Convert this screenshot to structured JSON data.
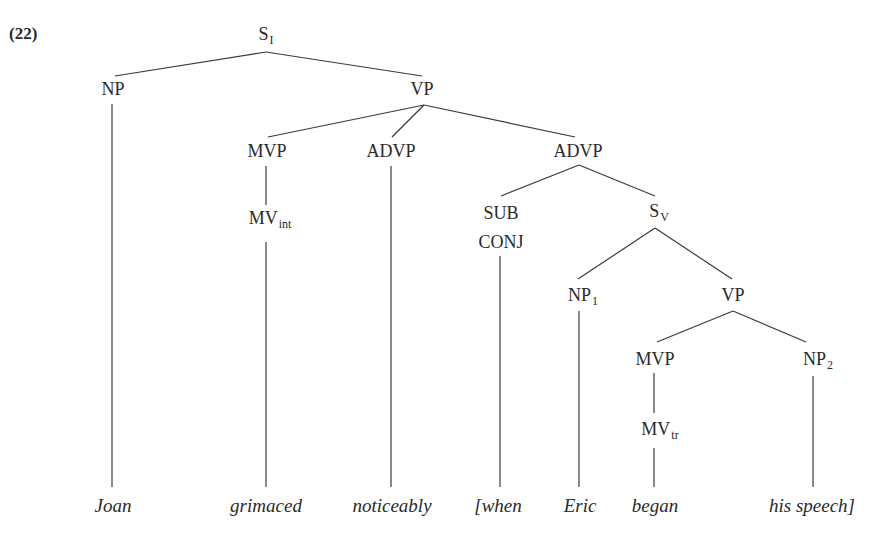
{
  "example_number": "(22)",
  "colors": {
    "text": "#2a2a2a",
    "line": "#3a3a3a",
    "background": "#ffffff"
  },
  "nodes": {
    "s_root": {
      "label": "S",
      "sub": "I"
    },
    "np_subject": {
      "label": "NP"
    },
    "vp_main": {
      "label": "VP"
    },
    "mvp_main": {
      "label": "MVP"
    },
    "mv_int": {
      "label": "MV",
      "sub": "int"
    },
    "advp_1": {
      "label": "ADVP"
    },
    "advp_2": {
      "label": "ADVP"
    },
    "sub_conj_line1": {
      "label": "SUB"
    },
    "sub_conj_line2": {
      "label": "CONJ"
    },
    "s_v": {
      "label": "S",
      "sub": "V"
    },
    "np_1": {
      "label": "NP",
      "sub": "1"
    },
    "vp_sub": {
      "label": "VP"
    },
    "mvp_sub": {
      "label": "MVP"
    },
    "mv_tr": {
      "label": "MV",
      "sub": "tr"
    },
    "np_2": {
      "label": "NP",
      "sub": "2"
    }
  },
  "leaves": [
    "Joan",
    "grimaced",
    "noticeably",
    "[when",
    "Eric",
    "began",
    "his speech]"
  ]
}
